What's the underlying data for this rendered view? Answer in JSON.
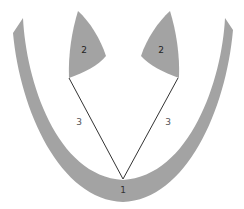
{
  "diagram": {
    "colors": {
      "background": "#ffffff",
      "shape_fill": "#a3a3a3",
      "line": "#333333",
      "label_dark": "#222222",
      "label_light": "#555555"
    },
    "labels": {
      "bottom_point": "1",
      "left_lobe": "2",
      "right_lobe": "2",
      "left_line": "3",
      "right_line": "3"
    }
  }
}
